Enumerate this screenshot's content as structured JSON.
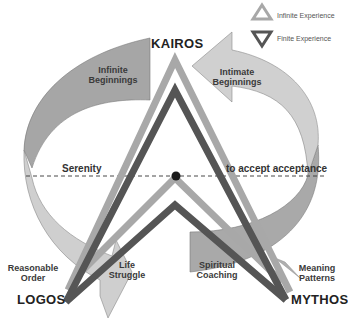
{
  "legend": {
    "items": [
      {
        "label": "Infinite Experience",
        "icon": "triangle-up-icon",
        "color": "#a8a8a8"
      },
      {
        "label": "Finite Experience",
        "icon": "triangle-down-icon",
        "color": "#555555"
      }
    ]
  },
  "poles": {
    "top": "KAIROS",
    "bottom_left": "LOGOS",
    "bottom_right": "MYTHOS"
  },
  "arrow_segments": {
    "top_left": {
      "line1": "Infinite",
      "line2": "Beginnings"
    },
    "top_right": {
      "line1": "Intimate",
      "line2": "Beginnings"
    },
    "bottom_left": {
      "line1": "Life",
      "line2": "Struggle"
    },
    "bottom_right": {
      "line1": "Spiritual",
      "line2": "Coaching"
    }
  },
  "axis_labels": {
    "left": "Serenity",
    "right": "to accept acceptance"
  },
  "corner_labels": {
    "left": {
      "line1": "Reasonable",
      "line2": "Order"
    },
    "right": {
      "line1": "Meaning",
      "line2": "Patterns"
    }
  },
  "colors": {
    "infinite": "#a8a8a8",
    "finite": "#555555",
    "band_dark": "#9a9a9a",
    "band_light": "#cfcfcf",
    "band_mid": "#b5b5b5"
  }
}
